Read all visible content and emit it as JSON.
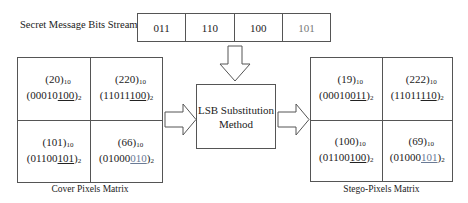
{
  "stream": {
    "label": "Secret Message Bits Stream",
    "bits": [
      "011",
      "110",
      "100",
      "101"
    ]
  },
  "cover": {
    "caption": "Cover Pixels Matrix",
    "cells": [
      {
        "dec": "(20)",
        "bin_head": "(00010",
        "bin_tail": "100",
        "bin_close": ")"
      },
      {
        "dec": "(220)",
        "bin_head": "(11011",
        "bin_tail": "100",
        "bin_close": ")"
      },
      {
        "dec": "(101)",
        "bin_head": "(01100",
        "bin_tail": "101",
        "bin_close": ")"
      },
      {
        "dec": "(66)",
        "bin_head": "(01000",
        "bin_tail": "010",
        "bin_close": ")"
      }
    ]
  },
  "stego": {
    "caption": "Stego-Pixels Matrix",
    "cells": [
      {
        "dec": "(19)",
        "bin_head": "(00010",
        "bin_tail": "011",
        "bin_close": ")"
      },
      {
        "dec": "(222)",
        "bin_head": "(11011",
        "bin_tail": "110",
        "bin_close": ")"
      },
      {
        "dec": "(100)",
        "bin_head": "(01100",
        "bin_tail": "100",
        "bin_close": ")"
      },
      {
        "dec": "(69)",
        "bin_head": "(01000",
        "bin_tail": "101",
        "bin_close": ")"
      }
    ]
  },
  "method": {
    "line1": "LSB Substitution",
    "line2": "Method"
  },
  "subscripts": {
    "decimal": "10",
    "binary": "2"
  }
}
